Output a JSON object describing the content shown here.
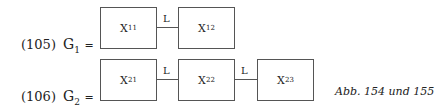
{
  "equations": [
    {
      "number": "(105)",
      "lhs": "G",
      "lhs_sub": "1",
      "eq": "=",
      "boxes": [
        {
          "var": "X",
          "sub": "11"
        },
        {
          "var": "X",
          "sub": "12"
        }
      ],
      "links": [
        "L"
      ]
    },
    {
      "number": "(106)",
      "lhs": "G",
      "lhs_sub": "2",
      "eq": "=",
      "boxes": [
        {
          "var": "X",
          "sub": "21"
        },
        {
          "var": "X",
          "sub": "22"
        },
        {
          "var": "X",
          "sub": "23"
        }
      ],
      "links": [
        "L",
        "L"
      ]
    }
  ],
  "caption": "Abb. 154 und 155"
}
